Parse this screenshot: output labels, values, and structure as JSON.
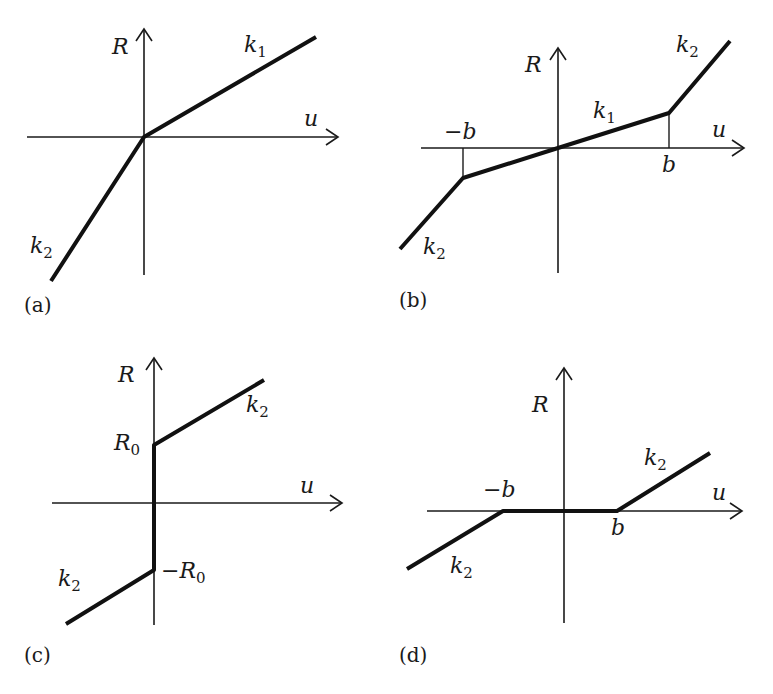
{
  "panels": {
    "a": {
      "caption": "(a)",
      "y_axis_label": "R",
      "x_axis_label": "u",
      "upper_slope_label": {
        "base": "k",
        "sub": "1"
      },
      "lower_slope_label": {
        "base": "k",
        "sub": "2"
      }
    },
    "b": {
      "caption": "(b)",
      "y_axis_label": "R",
      "x_axis_label": "u",
      "neg_break_label": "−b",
      "pos_break_label": "b",
      "middle_slope_label": {
        "base": "k",
        "sub": "1"
      },
      "upper_slope_label": {
        "base": "k",
        "sub": "2"
      },
      "lower_slope_label": {
        "base": "k",
        "sub": "2"
      }
    },
    "c": {
      "caption": "(c)",
      "y_axis_label": "R",
      "x_axis_label": "u",
      "pos_intercept_label": {
        "base": "R",
        "sub": "0"
      },
      "neg_intercept_label": {
        "base": "−R",
        "sub": "0"
      },
      "upper_slope_label": {
        "base": "k",
        "sub": "2"
      },
      "lower_slope_label": {
        "base": "k",
        "sub": "2"
      }
    },
    "d": {
      "caption": "(d)",
      "y_axis_label": "R",
      "x_axis_label": "u",
      "neg_break_label": "−b",
      "pos_break_label": "b",
      "upper_slope_label": {
        "base": "k",
        "sub": "2"
      },
      "lower_slope_label": {
        "base": "k",
        "sub": "2"
      }
    }
  }
}
